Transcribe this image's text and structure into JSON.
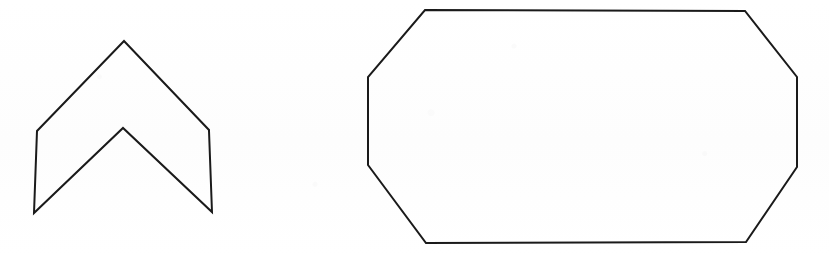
{
  "document": {
    "title": "Scanned Geometric Shapes",
    "background_color": "#fefefe",
    "width": 829,
    "height": 256,
    "medium": "scanned line drawing on white paper"
  },
  "style": {
    "stroke_color": "#1a1a1a",
    "stroke_width": 2,
    "fill": "none"
  },
  "shapes": [
    {
      "id": "chevron",
      "name": "chevron",
      "label": "Chevron / arrowhead outline",
      "sides": 6,
      "closed": true,
      "stroke_color": "#1a1a1a",
      "stroke_width": 2,
      "fill": "none",
      "bbox": {
        "x": 34,
        "y": 41,
        "width": 178,
        "height": 172
      },
      "points": "124,41 209,130 209,131 212,212 123,128 34,213 37,131",
      "vertices": [
        {
          "name": "outer-apex",
          "x": 124,
          "y": 41
        },
        {
          "name": "right-upper-corner",
          "x": 209,
          "y": 130
        },
        {
          "name": "bottom-right-tip",
          "x": 212,
          "y": 212
        },
        {
          "name": "inner-apex",
          "x": 123,
          "y": 128
        },
        {
          "name": "bottom-left-tip",
          "x": 34,
          "y": 213
        },
        {
          "name": "left-upper-corner",
          "x": 37,
          "y": 131
        }
      ]
    },
    {
      "id": "octagon",
      "name": "octagon",
      "label": "Elongated octagon outline",
      "sides": 8,
      "closed": true,
      "stroke_color": "#1a1a1a",
      "stroke_width": 2,
      "fill": "none",
      "bbox": {
        "x": 368,
        "y": 10,
        "width": 429,
        "height": 233
      },
      "points": "425,10 745,11 797,77 797,167 746,242 426,243 368,165 368,77",
      "vertices": [
        {
          "name": "top-left",
          "x": 425,
          "y": 10
        },
        {
          "name": "top-right",
          "x": 745,
          "y": 11
        },
        {
          "name": "right-upper",
          "x": 797,
          "y": 77
        },
        {
          "name": "right-lower",
          "x": 797,
          "y": 167
        },
        {
          "name": "bottom-right",
          "x": 746,
          "y": 242
        },
        {
          "name": "bottom-left",
          "x": 426,
          "y": 243
        },
        {
          "name": "left-lower",
          "x": 368,
          "y": 165
        },
        {
          "name": "left-upper",
          "x": 368,
          "y": 77
        }
      ]
    }
  ]
}
